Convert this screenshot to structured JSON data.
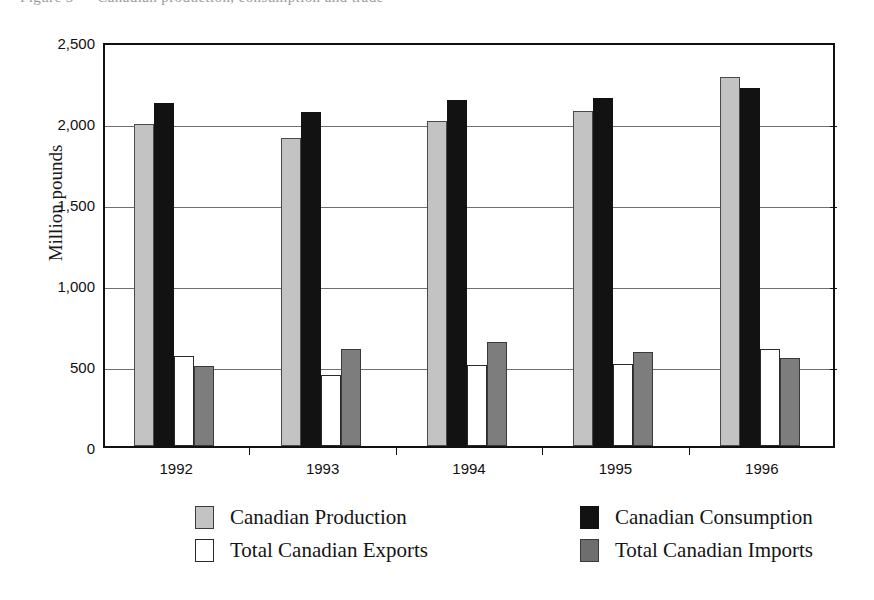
{
  "figure": {
    "cut_off_title": "Figure 3 — Canadian production, consumption and trade",
    "axis_title_y": "Million pounds"
  },
  "chart_data": {
    "type": "bar",
    "title": "",
    "xlabel": "",
    "ylabel": "Million pounds",
    "categories": [
      "1992",
      "1993",
      "1994",
      "1995",
      "1996"
    ],
    "ylim": [
      0,
      2500
    ],
    "yticks": [
      0,
      500,
      1000,
      1500,
      2000,
      2500
    ],
    "ytick_labels": [
      "0",
      "500",
      "1,000",
      "1,500",
      "2,000",
      "2,500"
    ],
    "grid": true,
    "legend_position": "bottom",
    "series": [
      {
        "name": "Canadian Production",
        "color": "#c3c3c3",
        "values": [
          1985,
          1900,
          2005,
          2065,
          2280
        ]
      },
      {
        "name": "Canadian Consumption",
        "color": "#121212",
        "values": [
          2120,
          2060,
          2135,
          2150,
          2210
        ]
      },
      {
        "name": "Total Canadian Exports",
        "color": "#ffffff",
        "values": [
          555,
          440,
          500,
          505,
          600
        ]
      },
      {
        "name": "Total Canadian Imports",
        "color": "#7d7d7d",
        "values": [
          495,
          600,
          645,
          580,
          545
        ]
      }
    ]
  },
  "legend": {
    "entries": [
      {
        "label": "Canadian Production",
        "swatch": "sw-production",
        "name": "legend-swatch-production"
      },
      {
        "label": "Canadian Consumption",
        "swatch": "sw-consumption",
        "name": "legend-swatch-consumption"
      },
      {
        "label": "Total Canadian Exports",
        "swatch": "sw-exports",
        "name": "legend-swatch-exports"
      },
      {
        "label": "Total Canadian Imports",
        "swatch": "sw-imports",
        "name": "legend-swatch-imports"
      }
    ]
  }
}
